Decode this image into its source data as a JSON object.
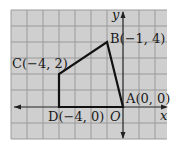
{
  "figure": {
    "type": "coordinate-plane-quadrilateral",
    "axes": {
      "x_label": "x",
      "y_label": "y",
      "origin_label": "O"
    },
    "grid": {
      "background": "#cfcfcf",
      "line_color": "#9a9a9a",
      "cell_px": 16
    },
    "polygon_color": "#111111",
    "points": [
      {
        "name": "A",
        "label": "A(0, 0)",
        "x": 0,
        "y": 0
      },
      {
        "name": "B",
        "label": "B(−1, 4)",
        "x": -1,
        "y": 4
      },
      {
        "name": "C",
        "label": "C(−4, 2)",
        "x": -4,
        "y": 2
      },
      {
        "name": "D",
        "label": "D(−4, 0)",
        "x": -4,
        "y": 0
      }
    ]
  }
}
